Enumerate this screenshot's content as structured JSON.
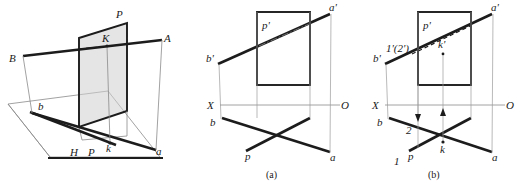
{
  "figure": {
    "panel_count": 3,
    "colors": {
      "ink": "#1c1c1c",
      "thin_line": "#8a8a8a",
      "plane_fill": "#cfcfcf",
      "background": "#ffffff"
    }
  },
  "pictorial": {
    "caption": "",
    "labels": {
      "plane_P_top": "P",
      "point_K": "K",
      "line_end_A": "A",
      "line_end_B": "B",
      "h_proj_b": "b",
      "h_proj_a": "a",
      "h_plane": "H",
      "trace_p": "P",
      "h_proj_k": "k"
    }
  },
  "diagram_a": {
    "caption": "(a)",
    "labels": {
      "plane_front": "p'",
      "line_end_a_prime": "a'",
      "line_end_b_prime": "b'",
      "axis_X": "X",
      "axis_O": "O",
      "h_proj_b": "b",
      "h_proj_a": "a",
      "h_trace_p": "p"
    }
  },
  "diagram_b": {
    "caption": "(b)",
    "labels": {
      "plane_front": "p'",
      "line_end_a_prime": "a'",
      "line_end_b_prime": "b'",
      "point_k_prime": "k'",
      "overlap_points": "1'(2')",
      "axis_X": "X",
      "axis_O": "O",
      "h_proj_b": "b",
      "h_proj_a": "a",
      "h_trace_p": "p",
      "h_proj_k": "k",
      "point_1": "1",
      "point_2": "2"
    }
  }
}
